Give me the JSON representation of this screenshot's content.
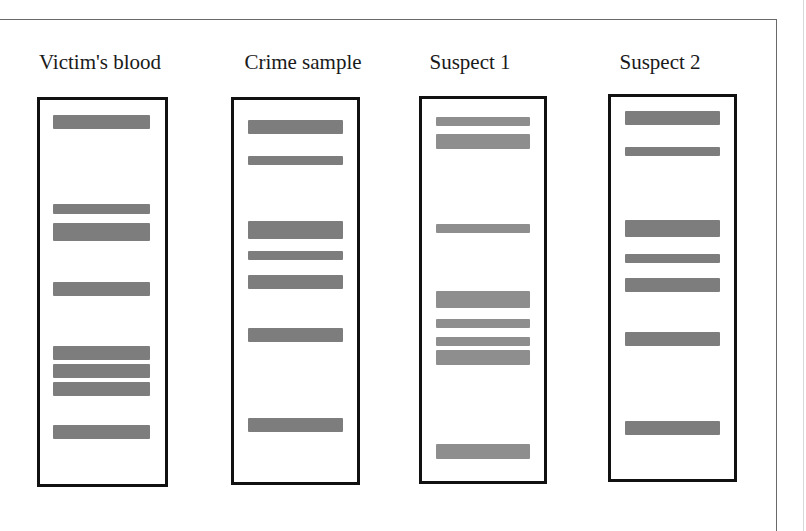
{
  "figure": {
    "type": "DNA fingerprint gel electrophoresis",
    "band_color": "#7d7d7d",
    "lane_border_color": "#111111"
  },
  "lanes": [
    {
      "label": "Victim's blood",
      "label_x": 100,
      "box": {
        "x": 37,
        "y": 97,
        "w": 131,
        "h": 390
      },
      "band_x": 53,
      "band_w": 97,
      "bands": [
        {
          "y": 115,
          "h": 14
        },
        {
          "y": 204,
          "h": 10
        },
        {
          "y": 223,
          "h": 18
        },
        {
          "y": 282,
          "h": 14
        },
        {
          "y": 346,
          "h": 14
        },
        {
          "y": 364,
          "h": 14
        },
        {
          "y": 382,
          "h": 14
        },
        {
          "y": 425,
          "h": 14
        }
      ]
    },
    {
      "label": "Crime sample",
      "label_x": 303,
      "box": {
        "x": 231,
        "y": 97,
        "w": 129,
        "h": 388
      },
      "band_x": 248,
      "band_w": 95,
      "bands": [
        {
          "y": 120,
          "h": 14
        },
        {
          "y": 156,
          "h": 9
        },
        {
          "y": 221,
          "h": 18
        },
        {
          "y": 251,
          "h": 9
        },
        {
          "y": 275,
          "h": 14
        },
        {
          "y": 328,
          "h": 14
        },
        {
          "y": 418,
          "h": 14
        }
      ]
    },
    {
      "label": "Suspect 1",
      "label_x": 470,
      "box": {
        "x": 419,
        "y": 96,
        "w": 128,
        "h": 388
      },
      "band_x": 436,
      "band_w": 94,
      "light": true,
      "bands": [
        {
          "y": 117,
          "h": 9
        },
        {
          "y": 134,
          "h": 15
        },
        {
          "y": 224,
          "h": 9
        },
        {
          "y": 291,
          "h": 17
        },
        {
          "y": 319,
          "h": 9
        },
        {
          "y": 337,
          "h": 9
        },
        {
          "y": 350,
          "h": 15
        },
        {
          "y": 444,
          "h": 15
        }
      ]
    },
    {
      "label": "Suspect 2",
      "label_x": 660,
      "box": {
        "x": 608,
        "y": 94,
        "w": 129,
        "h": 388
      },
      "band_x": 625,
      "band_w": 95,
      "bands": [
        {
          "y": 111,
          "h": 14
        },
        {
          "y": 147,
          "h": 9
        },
        {
          "y": 220,
          "h": 17
        },
        {
          "y": 254,
          "h": 9
        },
        {
          "y": 278,
          "h": 14
        },
        {
          "y": 332,
          "h": 14
        },
        {
          "y": 421,
          "h": 14
        }
      ]
    }
  ]
}
